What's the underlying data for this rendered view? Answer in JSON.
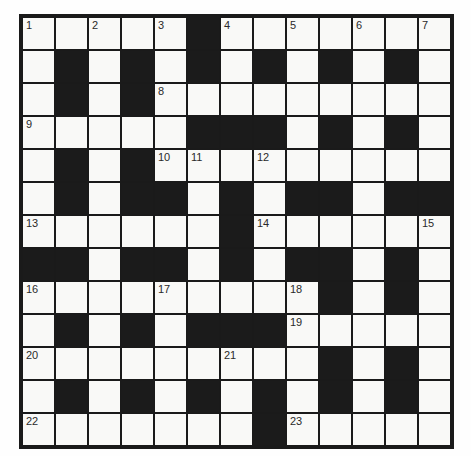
{
  "page": {
    "background": "#fefefe"
  },
  "crossword": {
    "type": "crossword-grid",
    "rows": 13,
    "cols": 13,
    "cell_size_px": 33,
    "colors": {
      "white_cell": "#f9f9f7",
      "black_cell": "#1b1b1b",
      "grid_line": "#1a1a1a",
      "number_text": "#2a2a2a"
    },
    "grid": [
      ".....#.......",
      ".#.#.#.#.#.#.",
      ".#.#.........",
      ".....###.#.#.",
      ".#.#.........",
      ".#.##.#.##.##",
      "......#......",
      "##.##.#.##.#.",
      ".........#.#.",
      ".#.#.###.....",
      ".........#.#.",
      ".#.#.#.#.#.#.",
      ".......#....."
    ],
    "numbers": [
      {
        "row": 1,
        "col": 1,
        "label": "1"
      },
      {
        "row": 1,
        "col": 3,
        "label": "2"
      },
      {
        "row": 1,
        "col": 5,
        "label": "3"
      },
      {
        "row": 1,
        "col": 7,
        "label": "4"
      },
      {
        "row": 1,
        "col": 9,
        "label": "5"
      },
      {
        "row": 1,
        "col": 11,
        "label": "6"
      },
      {
        "row": 1,
        "col": 13,
        "label": "7"
      },
      {
        "row": 3,
        "col": 5,
        "label": "8"
      },
      {
        "row": 4,
        "col": 1,
        "label": "9"
      },
      {
        "row": 5,
        "col": 5,
        "label": "10"
      },
      {
        "row": 5,
        "col": 6,
        "label": "11"
      },
      {
        "row": 5,
        "col": 8,
        "label": "12"
      },
      {
        "row": 7,
        "col": 1,
        "label": "13"
      },
      {
        "row": 7,
        "col": 8,
        "label": "14"
      },
      {
        "row": 7,
        "col": 13,
        "label": "15"
      },
      {
        "row": 9,
        "col": 1,
        "label": "16"
      },
      {
        "row": 9,
        "col": 5,
        "label": "17"
      },
      {
        "row": 9,
        "col": 9,
        "label": "18"
      },
      {
        "row": 10,
        "col": 9,
        "label": "19"
      },
      {
        "row": 11,
        "col": 1,
        "label": "20"
      },
      {
        "row": 11,
        "col": 7,
        "label": "21"
      },
      {
        "row": 13,
        "col": 1,
        "label": "22"
      },
      {
        "row": 13,
        "col": 9,
        "label": "23"
      }
    ]
  }
}
